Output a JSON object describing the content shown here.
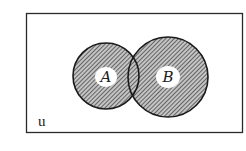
{
  "diagram": {
    "type": "venn",
    "universe": {
      "label": "u",
      "rect": {
        "x": 26.5,
        "y": 13.5,
        "width": 216,
        "height": 119
      }
    },
    "sets": [
      {
        "id": "A",
        "label": "A",
        "cx": 106,
        "cy": 76,
        "r": 33,
        "shaded": true
      },
      {
        "id": "B",
        "label": "B",
        "cx": 168,
        "cy": 77,
        "r": 40,
        "shaded": true
      }
    ],
    "intersection": {
      "shaded": true
    },
    "shaded_region": "A ∪ B",
    "colors": {
      "stroke": "#1a1a1a",
      "hatch": "#3a3a3a",
      "hatch_bg": "#bdbdbd",
      "label_patch": "#ffffff"
    }
  }
}
